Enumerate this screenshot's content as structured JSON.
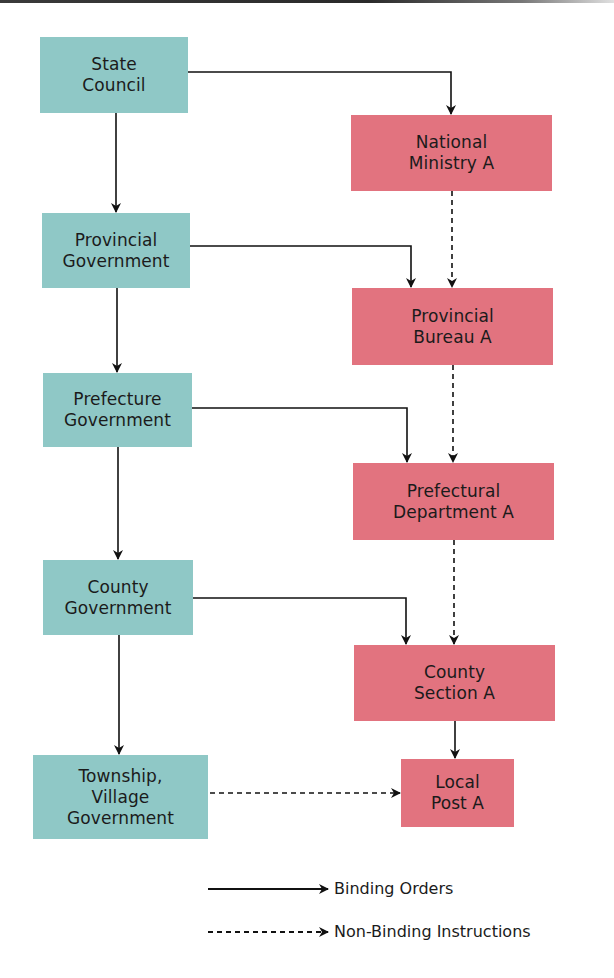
{
  "diagram": {
    "colors": {
      "government_box": "#8fc8c6",
      "ministry_box": "#e2737f",
      "line": "#111111"
    },
    "government_column": [
      {
        "id": "state-council",
        "label": "State\nCouncil"
      },
      {
        "id": "provincial-government",
        "label": "Provincial\nGovernment"
      },
      {
        "id": "prefecture-government",
        "label": "Prefecture\nGovernment"
      },
      {
        "id": "county-government",
        "label": "County\nGovernment"
      },
      {
        "id": "township-village-government",
        "label": "Township,\nVillage\nGovernment"
      }
    ],
    "ministry_column": [
      {
        "id": "national-ministry-a",
        "label": "National\nMinistry A"
      },
      {
        "id": "provincial-bureau-a",
        "label": "Provincial\nBureau A"
      },
      {
        "id": "prefectural-department-a",
        "label": "Prefectural\nDepartment A"
      },
      {
        "id": "county-section-a",
        "label": "County\nSection A"
      },
      {
        "id": "local-post-a",
        "label": "Local\nPost A"
      }
    ],
    "edges": [
      {
        "from": "State Council",
        "to": "Provincial Government",
        "type": "binding"
      },
      {
        "from": "Provincial Government",
        "to": "Prefecture Government",
        "type": "binding"
      },
      {
        "from": "Prefecture Government",
        "to": "County Government",
        "type": "binding"
      },
      {
        "from": "County Government",
        "to": "Township, Village Government",
        "type": "binding"
      },
      {
        "from": "State Council",
        "to": "National Ministry A",
        "type": "binding"
      },
      {
        "from": "Provincial Government",
        "to": "Provincial Bureau A",
        "type": "binding"
      },
      {
        "from": "Prefecture Government",
        "to": "Prefectural Department A",
        "type": "binding"
      },
      {
        "from": "County Government",
        "to": "County Section A",
        "type": "binding"
      },
      {
        "from": "County Section A",
        "to": "Local Post A",
        "type": "binding"
      },
      {
        "from": "National Ministry A",
        "to": "Provincial Bureau A",
        "type": "non-binding"
      },
      {
        "from": "Provincial Bureau A",
        "to": "Prefectural Department A",
        "type": "non-binding"
      },
      {
        "from": "Prefectural Department A",
        "to": "County Section A",
        "type": "non-binding"
      },
      {
        "from": "Township, Village Government",
        "to": "Local Post A",
        "type": "non-binding"
      }
    ],
    "legend": {
      "binding_label": "Binding Orders",
      "non_binding_label": "Non-Binding Instructions"
    }
  }
}
